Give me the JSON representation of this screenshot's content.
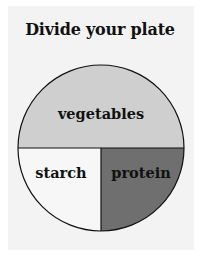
{
  "title": "Divide your plate",
  "plate": {
    "sections": [
      {
        "name": "vegetables",
        "label": "vegetables",
        "fraction": 0.5,
        "color": "#cfcfcf"
      },
      {
        "name": "starch",
        "label": "starch",
        "fraction": 0.25,
        "color": "#f7f7f7"
      },
      {
        "name": "protein",
        "label": "protein",
        "fraction": 0.25,
        "color": "#6f6f6f"
      }
    ],
    "outline_color": "#111111"
  }
}
